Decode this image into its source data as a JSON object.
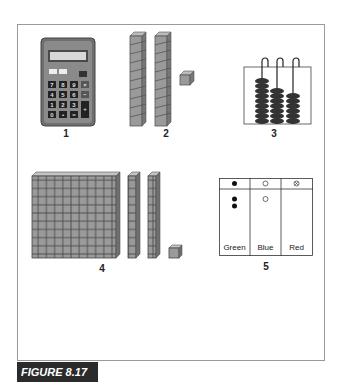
{
  "figure": {
    "label": "FIGURE 8.17"
  },
  "items": [
    {
      "number": "1",
      "name": "calculator",
      "keys": [
        [
          "7",
          "8",
          "9",
          "×"
        ],
        [
          "4",
          "5",
          "6",
          "−"
        ],
        [
          "1",
          "2",
          "3",
          "+"
        ],
        [
          "0",
          "•",
          "="
        ]
      ],
      "top_buttons": [
        "M",
        "AC"
      ]
    },
    {
      "number": "2",
      "name": "base-ten-rods-and-unit",
      "rods": 2,
      "units": 1,
      "rod_length": 10
    },
    {
      "number": "3",
      "name": "abacus",
      "beads_per_rod": [
        9,
        7,
        6
      ]
    },
    {
      "number": "4",
      "name": "base-ten-flat-rods-unit",
      "flats": 1,
      "rods": 2,
      "units": 1
    },
    {
      "number": "5",
      "name": "colored-chip-place-value-chart",
      "columns": [
        {
          "label": "Green",
          "header_symbol": "●",
          "chips": 2,
          "chip_symbol": "●"
        },
        {
          "label": "Blue",
          "header_symbol": "○",
          "chips": 1,
          "chip_symbol": "○"
        },
        {
          "label": "Red",
          "header_symbol": "⊗",
          "chips": 0,
          "chip_symbol": "⊗"
        }
      ]
    }
  ]
}
